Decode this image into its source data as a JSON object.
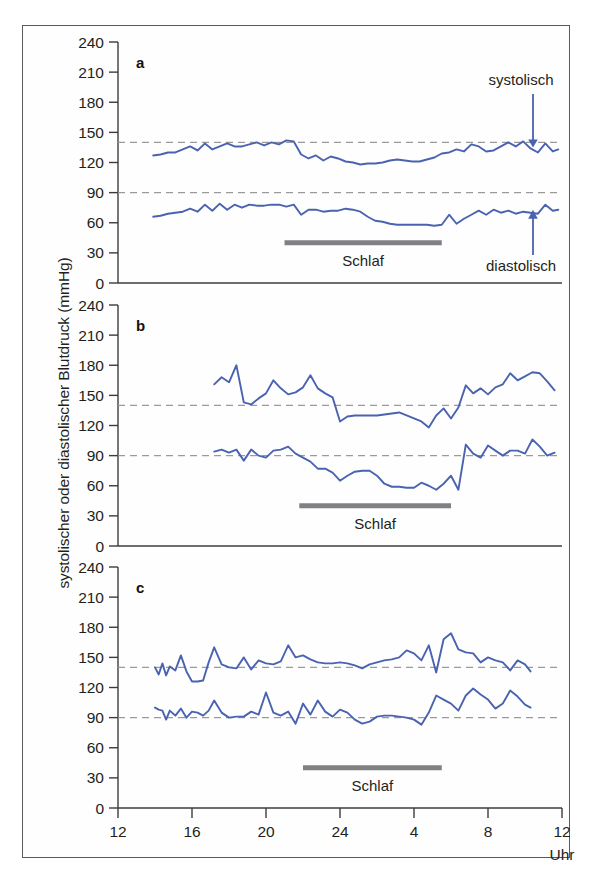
{
  "figure": {
    "ylabel": "systolischer oder diastolischer Blutdruck (mmHg)",
    "xunit": "Uhr",
    "sleep_label": "Schlaf",
    "annotation_systolic": "systolisch",
    "annotation_diastolic": "diastolisch",
    "line_color": "#4a63b0",
    "sleep_bar_color": "#7f8184",
    "threshold_color": "#9a9a9a",
    "axis_color": "#3c3c3c"
  },
  "chart_data": {
    "type": "line",
    "title": "",
    "xlabel": "Uhr",
    "ylabel": "systolischer oder diastolischer Blutdruck (mmHg)",
    "ylim": [
      0,
      240
    ],
    "yticks": [
      0,
      30,
      60,
      90,
      120,
      150,
      180,
      210,
      240
    ],
    "xlim": [
      12,
      36
    ],
    "xticks": [
      12,
      16,
      20,
      24,
      28,
      32,
      36
    ],
    "xticklabels": [
      "12",
      "16",
      "20",
      "24",
      "4",
      "8",
      "12"
    ],
    "grid": false,
    "legend": "annotations",
    "reference_lines": [
      {
        "value": 140,
        "label": "systolische Grenze",
        "style": "dashed"
      },
      {
        "value": 90,
        "label": "diastolische Grenze",
        "style": "dashed"
      }
    ],
    "panels": [
      {
        "id": "a",
        "label": "a",
        "description": "normaler Tag-Nacht-Rhythmus (Dipper)",
        "sleep_start": 21.0,
        "sleep_end": 29.5,
        "series": [
          {
            "name": "systolisch",
            "x": [
              13.9,
              14.3,
              14.7,
              15.1,
              15.5,
              15.9,
              16.3,
              16.7,
              17.1,
              17.5,
              17.9,
              18.3,
              18.7,
              19.1,
              19.5,
              19.9,
              20.3,
              20.7,
              21.1,
              21.5,
              21.9,
              22.3,
              22.7,
              23.1,
              23.5,
              23.9,
              24.3,
              24.7,
              25.1,
              25.5,
              25.9,
              26.3,
              26.7,
              27.1,
              27.5,
              27.9,
              28.3,
              28.7,
              29.1,
              29.5,
              29.9,
              30.3,
              30.7,
              31.1,
              31.5,
              31.9,
              32.3,
              32.7,
              33.1,
              33.5,
              33.9,
              34.3,
              34.7,
              35.1,
              35.5,
              35.8
            ],
            "y": [
              127,
              128,
              130,
              130,
              133,
              136,
              132,
              139,
              133,
              136,
              139,
              136,
              136,
              138,
              140,
              137,
              140,
              138,
              142,
              141,
              128,
              124,
              127,
              122,
              126,
              124,
              121,
              120,
              118,
              119,
              119,
              120,
              122,
              123,
              122,
              121,
              121,
              123,
              125,
              129,
              130,
              133,
              131,
              138,
              136,
              131,
              132,
              136,
              140,
              136,
              141,
              134,
              130,
              139,
              131,
              133
            ]
          },
          {
            "name": "diastolisch",
            "x": [
              13.9,
              14.3,
              14.7,
              15.1,
              15.5,
              15.9,
              16.3,
              16.7,
              17.1,
              17.5,
              17.9,
              18.3,
              18.7,
              19.1,
              19.5,
              19.9,
              20.3,
              20.7,
              21.1,
              21.5,
              21.9,
              22.3,
              22.7,
              23.1,
              23.5,
              23.9,
              24.3,
              24.7,
              25.1,
              25.5,
              25.9,
              26.3,
              26.7,
              27.1,
              27.5,
              27.9,
              28.3,
              28.7,
              29.1,
              29.5,
              29.9,
              30.3,
              30.7,
              31.1,
              31.5,
              31.9,
              32.3,
              32.7,
              33.1,
              33.5,
              33.9,
              34.3,
              34.7,
              35.1,
              35.5,
              35.8
            ],
            "y": [
              66,
              67,
              69,
              70,
              71,
              74,
              71,
              78,
              72,
              79,
              73,
              78,
              75,
              78,
              77,
              77,
              78,
              78,
              76,
              78,
              68,
              73,
              73,
              71,
              72,
              72,
              74,
              73,
              71,
              66,
              62,
              61,
              59,
              58,
              58,
              58,
              58,
              58,
              57,
              58,
              68,
              59,
              64,
              68,
              72,
              68,
              73,
              70,
              72,
              69,
              71,
              70,
              69,
              78,
              72,
              73
            ]
          }
        ]
      },
      {
        "id": "b",
        "label": "b",
        "description": "ausgeprägte Nachtabsenkung (Extreme Dipper)",
        "sleep_start": 21.8,
        "sleep_end": 30.0,
        "series": [
          {
            "name": "systolisch",
            "x": [
              17.2,
              17.6,
              18.0,
              18.4,
              18.8,
              19.2,
              19.6,
              20.0,
              20.4,
              20.8,
              21.2,
              21.6,
              22.0,
              22.4,
              22.8,
              23.2,
              23.6,
              24.0,
              24.4,
              24.8,
              25.2,
              25.6,
              26.0,
              26.4,
              26.8,
              27.2,
              27.6,
              28.0,
              28.4,
              28.8,
              29.2,
              29.6,
              30.0,
              30.4,
              30.8,
              31.2,
              31.6,
              32.0,
              32.4,
              32.8,
              33.2,
              33.6,
              34.0,
              34.4,
              34.8,
              35.2,
              35.6
            ],
            "y": [
              161,
              168,
              163,
              180,
              143,
              141,
              147,
              152,
              165,
              157,
              151,
              153,
              158,
              170,
              157,
              152,
              148,
              124,
              129,
              130,
              130,
              130,
              130,
              131,
              132,
              133,
              130,
              127,
              124,
              118,
              130,
              137,
              127,
              138,
              160,
              152,
              157,
              151,
              158,
              161,
              172,
              165,
              169,
              173,
              172,
              164,
              155
            ]
          },
          {
            "name": "diastolisch",
            "x": [
              17.2,
              17.6,
              18.0,
              18.4,
              18.8,
              19.2,
              19.6,
              20.0,
              20.4,
              20.8,
              21.2,
              21.6,
              22.0,
              22.4,
              22.8,
              23.2,
              23.6,
              24.0,
              24.4,
              24.8,
              25.2,
              25.6,
              26.0,
              26.4,
              26.8,
              27.2,
              27.6,
              28.0,
              28.4,
              28.8,
              29.2,
              29.6,
              30.0,
              30.4,
              30.8,
              31.2,
              31.6,
              32.0,
              32.4,
              32.8,
              33.2,
              33.6,
              34.0,
              34.4,
              34.8,
              35.2,
              35.6
            ],
            "y": [
              94,
              96,
              93,
              96,
              85,
              96,
              90,
              88,
              95,
              96,
              99,
              92,
              88,
              84,
              77,
              77,
              73,
              65,
              70,
              74,
              75,
              75,
              70,
              62,
              59,
              59,
              58,
              58,
              63,
              60,
              56,
              62,
              70,
              56,
              101,
              92,
              88,
              100,
              95,
              90,
              95,
              95,
              92,
              106,
              99,
              90,
              93
            ]
          }
        ]
      },
      {
        "id": "c",
        "label": "c",
        "description": "fehlende Nachtabsenkung (Non-Dipper)",
        "sleep_start": 22.0,
        "sleep_end": 29.5,
        "series": [
          {
            "name": "systolisch",
            "x": [
              14.0,
              14.2,
              14.4,
              14.6,
              14.8,
              15.1,
              15.4,
              15.7,
              16.0,
              16.3,
              16.6,
              16.9,
              17.2,
              17.6,
              18.0,
              18.4,
              18.8,
              19.2,
              19.6,
              20.0,
              20.4,
              20.8,
              21.2,
              21.6,
              22.0,
              22.4,
              22.8,
              23.2,
              23.6,
              24.0,
              24.4,
              24.8,
              25.2,
              25.6,
              26.0,
              26.4,
              26.8,
              27.2,
              27.6,
              28.0,
              28.4,
              28.8,
              29.2,
              29.6,
              30.0,
              30.4,
              30.8,
              31.2,
              31.6,
              32.0,
              32.4,
              32.8,
              33.2,
              33.6,
              34.0,
              34.3
            ],
            "y": [
              140,
              133,
              144,
              132,
              141,
              137,
              152,
              136,
              126,
              126,
              127,
              145,
              160,
              143,
              140,
              139,
              150,
              138,
              147,
              144,
              143,
              146,
              162,
              150,
              152,
              148,
              145,
              144,
              144,
              145,
              144,
              142,
              139,
              143,
              145,
              147,
              148,
              150,
              157,
              154,
              147,
              162,
              135,
              168,
              174,
              158,
              155,
              154,
              145,
              150,
              147,
              145,
              137,
              147,
              143,
              136
            ]
          },
          {
            "name": "diastolisch",
            "x": [
              14.0,
              14.2,
              14.4,
              14.6,
              14.8,
              15.1,
              15.4,
              15.7,
              16.0,
              16.3,
              16.6,
              16.9,
              17.2,
              17.6,
              18.0,
              18.4,
              18.8,
              19.2,
              19.6,
              20.0,
              20.4,
              20.8,
              21.2,
              21.6,
              22.0,
              22.4,
              22.8,
              23.2,
              23.6,
              24.0,
              24.4,
              24.8,
              25.2,
              25.6,
              26.0,
              26.4,
              26.8,
              27.2,
              27.6,
              28.0,
              28.4,
              28.8,
              29.2,
              29.6,
              30.0,
              30.4,
              30.8,
              31.2,
              31.6,
              32.0,
              32.4,
              32.8,
              33.2,
              33.6,
              34.0,
              34.3
            ],
            "y": [
              100,
              98,
              97,
              88,
              97,
              92,
              99,
              90,
              96,
              95,
              92,
              97,
              107,
              95,
              90,
              91,
              91,
              96,
              93,
              115,
              95,
              92,
              96,
              84,
              104,
              93,
              107,
              96,
              91,
              98,
              95,
              88,
              84,
              86,
              91,
              92,
              92,
              91,
              90,
              88,
              83,
              95,
              112,
              108,
              104,
              97,
              112,
              119,
              113,
              108,
              99,
              104,
              117,
              111,
              103,
              100
            ]
          }
        ]
      }
    ]
  }
}
